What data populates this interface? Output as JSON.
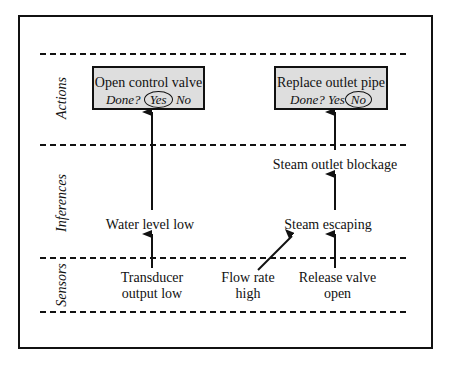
{
  "lanes": [
    {
      "label": "Actions"
    },
    {
      "label": "Inferences"
    },
    {
      "label": "Sensors"
    }
  ],
  "actions": [
    {
      "title": "Open control valve",
      "done_prompt": "Done?",
      "yes": "Yes",
      "no": "No",
      "selected": "Yes"
    },
    {
      "title": "Replace outlet pipe",
      "done_prompt": "Done?",
      "yes": "Yes",
      "no": "No",
      "selected": "No"
    }
  ],
  "inferences": [
    {
      "label": "Water level low"
    },
    {
      "label": "Steam escaping"
    },
    {
      "label": "Steam outlet blockage"
    }
  ],
  "sensors": [
    {
      "line1": "Transducer",
      "line2": "output low"
    },
    {
      "line1": "Flow rate",
      "line2": "high"
    },
    {
      "line1": "Release valve",
      "line2": "open"
    }
  ],
  "colors": {
    "box_fill": "#dedede",
    "line": "#111111",
    "background": "#ffffff"
  }
}
